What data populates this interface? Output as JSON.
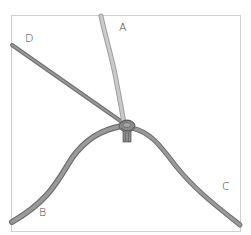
{
  "diagram": {
    "type": "knot-illustration",
    "labels": {
      "a": "A",
      "b": "B",
      "c": "C",
      "d": "D"
    },
    "colors": {
      "frame": "#cfcfcf",
      "cord_a": "#bdbdbd",
      "cord_other": "#8c8c8c",
      "cord_edge": "#6e6e6e",
      "knot": "#7a7a7a",
      "label": "#444444"
    }
  }
}
